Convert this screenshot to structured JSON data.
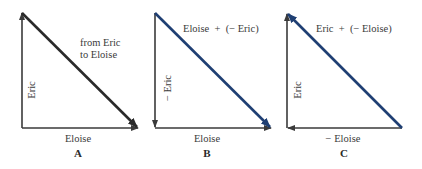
{
  "diagram": {
    "type": "vector-addition-triangles",
    "colors": {
      "component_vector": "#3a3a3a",
      "resultant_A": "#2a2a2a",
      "resultant_BC": "#1f3f73",
      "text": "#3a3a3a"
    },
    "panels": [
      {
        "id": "A",
        "letter": "A",
        "vertical_label": "Eric",
        "horizontal_label": "Eloise",
        "hypotenuse_label_line1": "from Eric",
        "hypotenuse_label_line2": "to Eloise"
      },
      {
        "id": "B",
        "letter": "B",
        "vertical_label": "− Eric",
        "horizontal_label": "Eloise",
        "hypotenuse_label": "Eloise  +  (− Eric)"
      },
      {
        "id": "C",
        "letter": "C",
        "vertical_label": "Eric",
        "horizontal_label": "− Eloise",
        "hypotenuse_label": "Eric  +  (− Eloise)"
      }
    ]
  }
}
